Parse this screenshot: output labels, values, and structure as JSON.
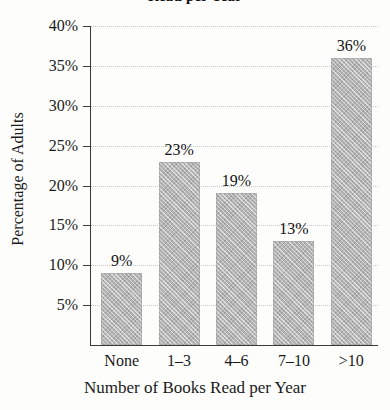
{
  "chart_data": {
    "type": "bar",
    "title": "Read per Year",
    "title_note": "title is clipped by the top edge of the screenshot",
    "xlabel": "Number of Books Read per Year",
    "ylabel": "Percentage of Adults",
    "categories": [
      "None",
      "1–3",
      "4–6",
      "7–10",
      ">10"
    ],
    "values": [
      9,
      23,
      19,
      13,
      36
    ],
    "value_labels": [
      "9%",
      "23%",
      "19%",
      "13%",
      "36%"
    ],
    "ylim": [
      0,
      40
    ],
    "yticks": [
      5,
      10,
      15,
      20,
      25,
      30,
      35,
      40
    ],
    "ytick_labels": [
      "5%",
      "10%",
      "15%",
      "20%",
      "25%",
      "30%",
      "35%",
      "40%"
    ],
    "grid": true,
    "grid_style": "dotted horizontal",
    "legend": "none",
    "bar_color": "#b5b5b5",
    "axis_color": "#3a3a3a",
    "grid_color": "#c9c9c9",
    "background_color": "#fdfdfc"
  }
}
